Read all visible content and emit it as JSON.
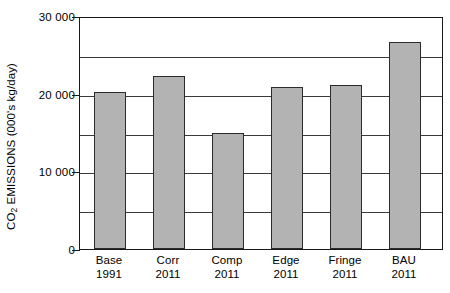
{
  "chart_data": {
    "type": "bar",
    "title": "",
    "xlabel": "",
    "ylabel": "CO2 EMISSIONS (000's kg/day)",
    "ylabel_parts": {
      "prefix": "CO",
      "sub": "2",
      "suffix": " EMISSIONS (000's kg/day)"
    },
    "categories": [
      "Base 1991",
      "Corr 2011",
      "Comp 2011",
      "Edge 2011",
      "Fringe 2011",
      "BAU 2011"
    ],
    "category_lines": [
      {
        "line1": "Base",
        "line2": "1991"
      },
      {
        "line1": "Corr",
        "line2": "2011"
      },
      {
        "line1": "Comp",
        "line2": "2011"
      },
      {
        "line1": "Edge",
        "line2": "2011"
      },
      {
        "line1": "Fringe",
        "line2": "2011"
      },
      {
        "line1": "BAU",
        "line2": "2011"
      }
    ],
    "values": [
      20400,
      22500,
      15100,
      21100,
      21300,
      26900
    ],
    "ylim": [
      0,
      30000
    ],
    "ytick_labels": [
      "0",
      "10 000",
      "20 000",
      "30 000"
    ],
    "ytick_values": [
      0,
      10000,
      20000,
      30000
    ],
    "gridline_values": [
      5000,
      10000,
      15000,
      20000,
      25000
    ],
    "grid": true,
    "legend": "none",
    "bar_color": "#b3b3b3",
    "bar_edge_color": "#2b2b2b",
    "axis_color": "#1a1a1a",
    "background": "#ffffff"
  }
}
